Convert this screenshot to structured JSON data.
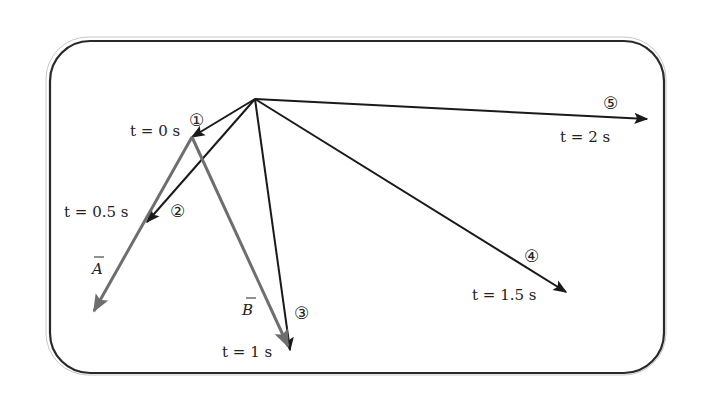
{
  "diagram": {
    "type": "position-vectors-over-time",
    "colors": {
      "position_vector": "#1a1a1a",
      "displacement_vector": "#6e6e6e",
      "frame": "#2a2a2a"
    },
    "origin": {
      "x": 255,
      "y": 99
    },
    "points": [
      {
        "id": 1,
        "marker": "①",
        "time_label": "t = 0 s",
        "x": 192,
        "y": 137
      },
      {
        "id": 2,
        "marker": "②",
        "time_label": "t = 0.5 s",
        "x": 147,
        "y": 222
      },
      {
        "id": 3,
        "marker": "③",
        "time_label": "t = 1 s",
        "x": 290,
        "y": 350
      },
      {
        "id": 4,
        "marker": "④",
        "time_label": "t = 1.5 s",
        "x": 566,
        "y": 292
      },
      {
        "id": 5,
        "marker": "⑤",
        "time_label": "t = 2 s",
        "x": 647,
        "y": 119
      }
    ],
    "vectors": [
      {
        "name": "A",
        "label": "A",
        "from_point": 1,
        "to": {
          "x": 94,
          "y": 311
        }
      },
      {
        "name": "B",
        "label": "B",
        "from_point": 1,
        "to_point": 3
      }
    ]
  }
}
